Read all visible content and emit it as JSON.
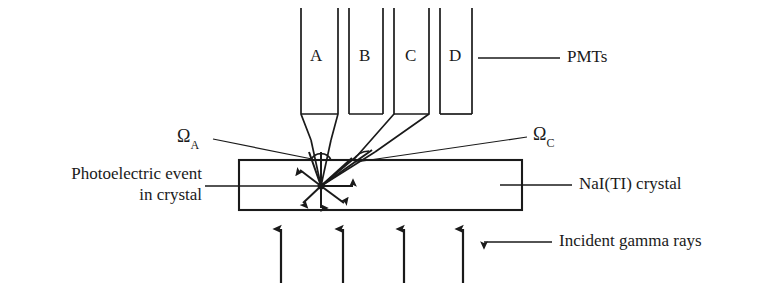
{
  "figure": {
    "type": "schematic-diagram"
  },
  "pmts": {
    "group_label": "PMTs",
    "tubes": [
      {
        "id": "A",
        "label": "A"
      },
      {
        "id": "B",
        "label": "B"
      },
      {
        "id": "C",
        "label": "C"
      },
      {
        "id": "D",
        "label": "D"
      }
    ]
  },
  "solid_angles": [
    {
      "id": "omega-a",
      "symbol": "Ω",
      "subscript": "A"
    },
    {
      "id": "omega-c",
      "symbol": "Ω",
      "subscript": "C"
    }
  ],
  "labels": {
    "event": {
      "line1": "Photoelectric event",
      "line2": "in crystal"
    },
    "crystal": "NaI(TI) crystal",
    "incident": "Incident gamma rays"
  },
  "colors": {
    "stroke": "#1a1a1a",
    "background": "#ffffff",
    "text": "#1a1a1a"
  }
}
